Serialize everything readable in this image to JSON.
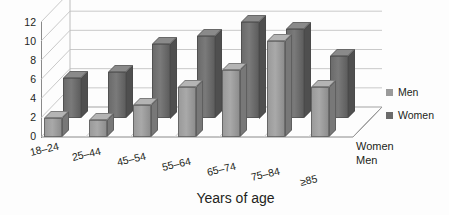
{
  "chart_data": {
    "type": "bar",
    "title": "",
    "xlabel": "Years of age",
    "ylabel": "",
    "ylim": [
      0,
      12
    ],
    "yticks": [
      12,
      10,
      8,
      6,
      4,
      2,
      0
    ],
    "grid": true,
    "legend_position": "right",
    "depth_axis_labels": [
      "Women",
      "Men"
    ],
    "categories": [
      "18–24",
      "25–44",
      "45–54",
      "55–64",
      "65–74",
      "75–84",
      "≥85"
    ],
    "series": [
      {
        "name": "Men",
        "color": "#9a9a9a",
        "values": [
          2.0,
          1.8,
          3.3,
          5.2,
          7.0,
          10.0,
          5.2
        ]
      },
      {
        "name": "Women",
        "color": "#6b6b6b",
        "values": [
          4.2,
          4.8,
          7.8,
          8.6,
          10.1,
          9.3,
          6.5
        ]
      }
    ]
  },
  "legend": {
    "items": [
      {
        "label": "Men",
        "swatch": "men-swatch"
      },
      {
        "label": "Women",
        "swatch": "women-swatch"
      }
    ]
  },
  "axis": {
    "x_title": "Years of age",
    "depth_back": "Women",
    "depth_front": "Men"
  }
}
